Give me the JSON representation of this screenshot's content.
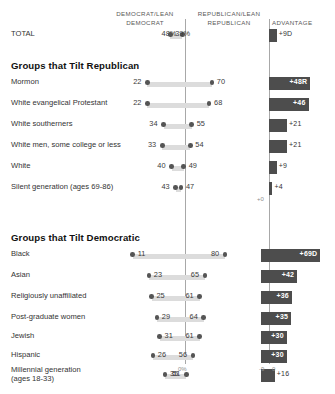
{
  "headers": {
    "democrat": "DEMOCRAT/LEAN\nDEMOCRAT",
    "democrat_line1": "DEMOCRAT/LEAN",
    "democrat_line2": "DEMOCRAT",
    "republican_line1": "REPUBLICAN/LEAN",
    "republican_line2": "REPUBLICAN",
    "advantage": "ADVANTAGE"
  },
  "sections": {
    "republican_title": "Groups that Tilt Republican",
    "democratic_title": "Groups that Tilt Democratic"
  },
  "axis": {
    "zero_percent": "0%",
    "adv_neg9": "-9",
    "adv_zero": "0",
    "adv_plus0": "+0"
  },
  "colors": {
    "track": "#dcdcdc",
    "dot": "#555555",
    "adv_bar": "#4d4d4d",
    "rule": "#a8a8a8",
    "text": "#333333"
  },
  "chart_data": {
    "type": "bar",
    "xlabel": "Percent",
    "ylabel": "",
    "xlim": [
      0,
      100
    ],
    "grid": false,
    "legend_position": "top",
    "series": [
      {
        "name": "Democrat/Lean Democrat",
        "key": "dem"
      },
      {
        "name": "Republican/Lean Republican",
        "key": "rep"
      }
    ],
    "advantage_axis": {
      "label": "ADVANTAGE",
      "ticks": [
        -9,
        0
      ],
      "ticklabels": [
        "-9",
        "0"
      ],
      "range": [
        -9,
        72
      ]
    },
    "rows": [
      {
        "group": "total",
        "label": "TOTAL",
        "dem": 48,
        "rep": 39,
        "dem_display": "48%",
        "rep_display": "39%",
        "advantage": 9,
        "advantage_display": "+9D",
        "advantage_label_inside": false
      },
      {
        "group": "republican",
        "label": "Mormon",
        "dem": 22,
        "rep": 70,
        "dem_display": "22",
        "rep_display": "70",
        "advantage": 48,
        "advantage_display": "+48R",
        "advantage_label_inside": true
      },
      {
        "group": "republican",
        "label": "White evangelical Protestant",
        "dem": 22,
        "rep": 68,
        "dem_display": "22",
        "rep_display": "68",
        "advantage": 46,
        "advantage_display": "+46",
        "advantage_label_inside": true
      },
      {
        "group": "republican",
        "label": "White southerners",
        "dem": 34,
        "rep": 55,
        "dem_display": "34",
        "rep_display": "55",
        "advantage": 21,
        "advantage_display": "+21",
        "advantage_label_inside": false
      },
      {
        "group": "republican",
        "label": "White men, some college or less",
        "dem": 33,
        "rep": 54,
        "dem_display": "33",
        "rep_display": "54",
        "advantage": 21,
        "advantage_display": "+21",
        "advantage_label_inside": false
      },
      {
        "group": "republican",
        "label": "White",
        "dem": 40,
        "rep": 49,
        "dem_display": "40",
        "rep_display": "49",
        "advantage": 9,
        "advantage_display": "+9",
        "advantage_label_inside": false
      },
      {
        "group": "republican",
        "label": "Silent generation (ages 69-86)",
        "dem": 43,
        "rep": 47,
        "dem_display": "43",
        "rep_display": "47",
        "advantage": 4,
        "advantage_display": "+4",
        "advantage_label_inside": false
      },
      {
        "group": "democratic",
        "label": "Black",
        "dem": 80,
        "rep": 11,
        "dem_display": "80",
        "rep_display": "11",
        "advantage": 69,
        "advantage_display": "+69D",
        "advantage_label_inside": true
      },
      {
        "group": "democratic",
        "label": "Asian",
        "dem": 65,
        "rep": 23,
        "dem_display": "65",
        "rep_display": "23",
        "advantage": 42,
        "advantage_display": "+42",
        "advantage_label_inside": true
      },
      {
        "group": "democratic",
        "label": "Religiously unaffiliated",
        "dem": 61,
        "rep": 25,
        "dem_display": "61",
        "rep_display": "25",
        "advantage": 36,
        "advantage_display": "+36",
        "advantage_label_inside": true
      },
      {
        "group": "democratic",
        "label": "Post-graduate women",
        "dem": 64,
        "rep": 29,
        "dem_display": "64",
        "rep_display": "29",
        "advantage": 35,
        "advantage_display": "+35",
        "advantage_label_inside": true
      },
      {
        "group": "democratic",
        "label": "Jewish",
        "dem": 61,
        "rep": 31,
        "dem_display": "61",
        "rep_display": "31",
        "advantage": 30,
        "advantage_display": "+30",
        "advantage_label_inside": true
      },
      {
        "group": "democratic",
        "label": "Hispanic",
        "dem": 56,
        "rep": 26,
        "dem_display": "56",
        "rep_display": "26",
        "advantage": 30,
        "advantage_display": "+30",
        "advantage_label_inside": true
      },
      {
        "group": "democratic",
        "label": "Millennial generation",
        "label_line2": "(ages 18-33)",
        "dem": 51,
        "rep": 35,
        "dem_display": "51",
        "rep_display": "35",
        "advantage": 16,
        "advantage_display": "+16",
        "advantage_label_inside": false
      }
    ]
  }
}
